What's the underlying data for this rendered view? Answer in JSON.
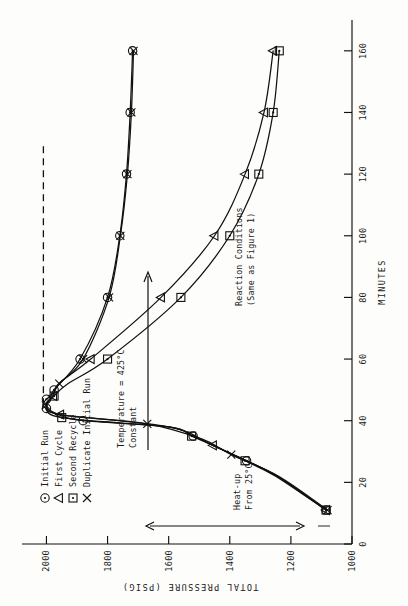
{
  "figure": {
    "rotation_note": "page-rotated-90",
    "axis_title_y": "TOTAL PRESSURE  (PSIG)",
    "axis_title_x": "MINUTES"
  },
  "annotations": {
    "heatup_line1": "Heat-up",
    "heatup_line2": "From 25°C",
    "constant_line1": "Constant",
    "constant_line2": "Temperature = 425°C",
    "conditions_line1": "Reaction Conditions",
    "conditions_line2": "(Same as Figure 1)"
  },
  "legend": {
    "items": [
      {
        "symbol": "circle-dot",
        "label": "Initial Run"
      },
      {
        "symbol": "triangle",
        "label": "First Cycle"
      },
      {
        "symbol": "square-dot",
        "label": "Second Recycle"
      },
      {
        "symbol": "cross",
        "label": "Duplicate Initial Run"
      }
    ]
  },
  "chart_data": {
    "type": "line",
    "title": "",
    "xlabel": "MINUTES",
    "ylabel": "TOTAL PRESSURE  (PSIG)",
    "xlim": [
      0,
      170
    ],
    "ylim": [
      1000,
      2080
    ],
    "xticks": [
      0,
      20,
      40,
      60,
      80,
      100,
      120,
      140,
      160
    ],
    "yticks": [
      1000,
      1200,
      1400,
      1600,
      1800,
      2000
    ],
    "grid": false,
    "legend_position": "upper-left",
    "reference_lines": [
      {
        "orientation": "horizontal",
        "value": 2010,
        "style": "dashed",
        "x_from": 45,
        "x_to": 130
      }
    ],
    "series": [
      {
        "name": "Initial Run",
        "symbol": "circle-dot",
        "points": [
          [
            11,
            1085
          ],
          [
            22,
            1245
          ],
          [
            27,
            1345
          ],
          [
            32,
            1455
          ],
          [
            35,
            1520
          ],
          [
            38,
            1600
          ],
          [
            40,
            1880
          ],
          [
            42,
            1960
          ],
          [
            44,
            2000
          ],
          [
            45,
            2012
          ],
          [
            47,
            2000
          ],
          [
            48,
            1985
          ],
          [
            50,
            1975
          ],
          [
            60,
            1890
          ],
          [
            80,
            1800
          ],
          [
            100,
            1760
          ],
          [
            120,
            1738
          ],
          [
            140,
            1726
          ],
          [
            160,
            1718
          ]
        ]
      },
      {
        "name": "First Cycle",
        "symbol": "triangle",
        "points": [
          [
            11,
            1085
          ],
          [
            22,
            1245
          ],
          [
            32,
            1455
          ],
          [
            38,
            1600
          ],
          [
            42,
            1955
          ],
          [
            45,
            2000
          ],
          [
            48,
            1978
          ],
          [
            52,
            1960
          ],
          [
            60,
            1855
          ],
          [
            80,
            1625
          ],
          [
            100,
            1450
          ],
          [
            120,
            1350
          ],
          [
            140,
            1288
          ],
          [
            160,
            1258
          ]
        ]
      },
      {
        "name": "Second Recycle",
        "symbol": "square-dot",
        "points": [
          [
            11,
            1085
          ],
          [
            22,
            1250
          ],
          [
            27,
            1350
          ],
          [
            32,
            1455
          ],
          [
            35,
            1525
          ],
          [
            38,
            1600
          ],
          [
            41,
            1950
          ],
          [
            45,
            1998
          ],
          [
            48,
            1975
          ],
          [
            52,
            1930
          ],
          [
            60,
            1800
          ],
          [
            80,
            1560
          ],
          [
            100,
            1400
          ],
          [
            120,
            1305
          ],
          [
            140,
            1258
          ],
          [
            160,
            1238
          ]
        ]
      },
      {
        "name": "Duplicate Initial Run",
        "symbol": "cross",
        "points": [
          [
            11,
            1080
          ],
          [
            22,
            1240
          ],
          [
            29,
            1395
          ],
          [
            34,
            1490
          ],
          [
            39,
            1670
          ],
          [
            42,
            1955
          ],
          [
            45,
            2002
          ],
          [
            48,
            1980
          ],
          [
            52,
            1958
          ],
          [
            60,
            1880
          ],
          [
            80,
            1795
          ],
          [
            100,
            1758
          ],
          [
            120,
            1735
          ],
          [
            140,
            1722
          ],
          [
            160,
            1715
          ]
        ]
      }
    ]
  }
}
